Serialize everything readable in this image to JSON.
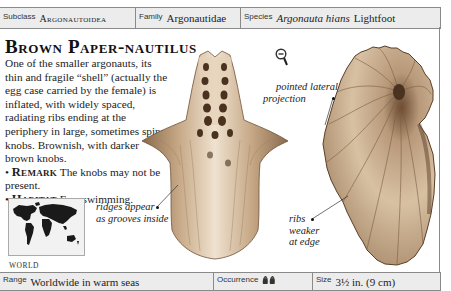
{
  "header": {
    "subclass": {
      "label": "Subclass",
      "value": "Argonautoidea"
    },
    "family": {
      "label": "Family",
      "value": "Argonautidae"
    },
    "species": {
      "label": "Species",
      "value_italic": "Argonauta hians",
      "author": "Lightfoot"
    }
  },
  "title": "Brown Paper-nautilus",
  "description": {
    "text": "One of the smaller argonauts, its thin and fragile “shell” (actually the egg case carried by the female) is inflated, with widely spaced, radiating ribs ending at the periphery in large, sometimes spiny knobs. Brownish, with darker brown knobs.",
    "remark_label": "Remark",
    "remark_text": "The knobs may not be present.",
    "habitat_label": "Habitat",
    "habitat_text": "Free swimming.",
    "bullet": "•"
  },
  "map": {
    "label": "WORLD",
    "icon": "world-map"
  },
  "annotations": {
    "pointed_line1": "pointed lateral",
    "pointed_line2": "projection",
    "ridges_line1": "ridges appear",
    "ridges_line2": "as grooves inside",
    "ribs_line1": "ribs",
    "ribs_line2": "weaker",
    "ribs_line3": "at edge"
  },
  "icons": {
    "magnifier": "zoom-out-magnifier-icon",
    "occurrence": "occurrence-shells-icon"
  },
  "footer": {
    "range": {
      "label": "Range",
      "value": "Worldwide in warm seas"
    },
    "occurrence": {
      "label": "Occurrence",
      "value": "2 of 4"
    },
    "size": {
      "label": "Size",
      "value": "3½ in. (9 cm)"
    }
  },
  "colors": {
    "bar_bg": "#ececec",
    "border": "#8a8a8a",
    "shell_light": "#ecdcc6",
    "shell_mid": "#b89a78",
    "shell_dark": "#5a3e28"
  }
}
